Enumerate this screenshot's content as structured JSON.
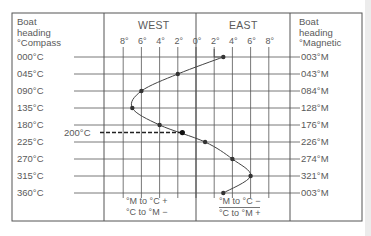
{
  "chart_data": {
    "type": "line",
    "left_header": [
      "Boat",
      "heading",
      "°Compass"
    ],
    "right_header": [
      "Boat",
      "heading",
      "°Magnetic"
    ],
    "regions": [
      "WEST",
      "EAST"
    ],
    "x_ticks": [
      "8°",
      "6°",
      "4°",
      "2°",
      "0°",
      "2°",
      "4°",
      "6°",
      "8°"
    ],
    "xlabel": "Deviation (West − / East +)",
    "xlim": [
      -8,
      8
    ],
    "compass_headings": [
      "000°C",
      "045°C",
      "090°C",
      "135°C",
      "180°C",
      "225°C",
      "270°C",
      "315°C",
      "360°C"
    ],
    "magnetic_headings": [
      "003°M",
      "043°M",
      "084°M",
      "128°M",
      "176°M",
      "226°M",
      "274°M",
      "321°M",
      "003°M"
    ],
    "series": [
      {
        "name": "Deviation",
        "compass": [
          0,
          45,
          90,
          135,
          180,
          225,
          270,
          315,
          360
        ],
        "values": [
          3,
          -2,
          -6,
          -7,
          -4,
          1,
          4,
          6,
          3
        ]
      }
    ],
    "annotation": {
      "label": "200°C",
      "compass": 200,
      "deviation": -1.5,
      "style": "dashed"
    },
    "footnotes": {
      "west": [
        "°M to °C +",
        "°C to °M −"
      ],
      "east": [
        "°M to °C −",
        "°C to °M +"
      ]
    }
  },
  "colors": {
    "line": "#444444",
    "border": "#555555",
    "text": "#5a5a5a"
  }
}
